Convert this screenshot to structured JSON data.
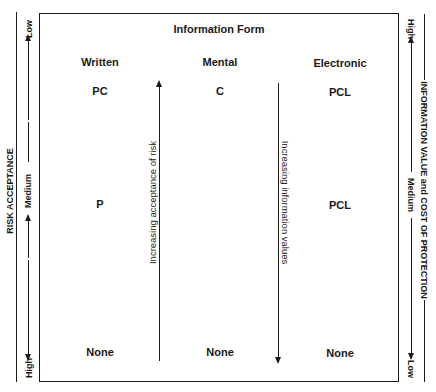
{
  "title": "Information Form",
  "columns": [
    {
      "header": "Written",
      "high": "PC",
      "medium": "P",
      "low": "None"
    },
    {
      "header": "Mental",
      "high": "C",
      "medium": "",
      "low": "None"
    },
    {
      "header": "Electronic",
      "high": "PCL",
      "medium": "PCL",
      "low": "None"
    }
  ],
  "left_axis": {
    "label": "RISK ACCEPTANCE",
    "top": "Low",
    "middle": "Medium",
    "bottom": "High"
  },
  "right_axis": {
    "label": "INFORMATION VALUE and COST OF PROTECTION",
    "top": "High",
    "middle": "Medium",
    "bottom": "Low"
  },
  "inner_arrows": {
    "risk": "Increasing acceptance of risk",
    "value": "Increasing information values"
  }
}
